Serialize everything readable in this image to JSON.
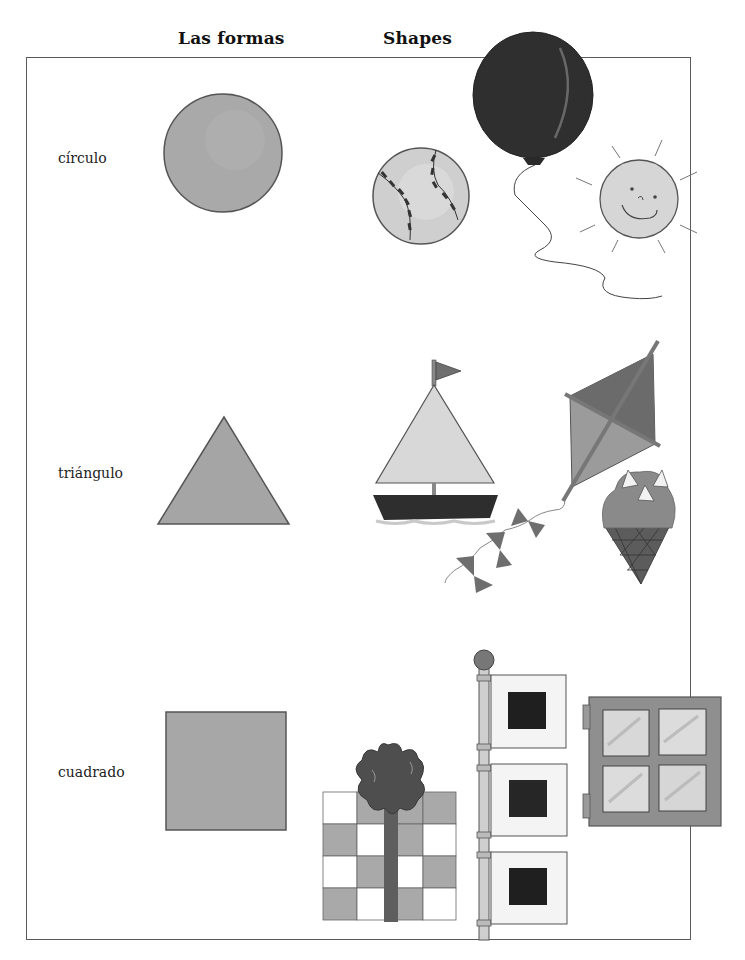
{
  "header": {
    "title_es": "Las formas",
    "title_en": "Shapes"
  },
  "rows": [
    {
      "label": "círculo",
      "shape": "circle",
      "examples": [
        "baseball",
        "balloon",
        "sun"
      ]
    },
    {
      "label": "triángulo",
      "shape": "triangle",
      "examples": [
        "sailboat",
        "kite",
        "ice-cream-cone"
      ]
    },
    {
      "label": "cuadrado",
      "shape": "square",
      "examples": [
        "gift-box",
        "flags",
        "window"
      ]
    }
  ],
  "colors": {
    "shape_fill": "#a8a8a8",
    "light_fill": "#d4d4d4",
    "dark_fill": "#3a3a3a",
    "outline": "#555555",
    "frame": "#5a5a5a",
    "text": "#111111"
  }
}
